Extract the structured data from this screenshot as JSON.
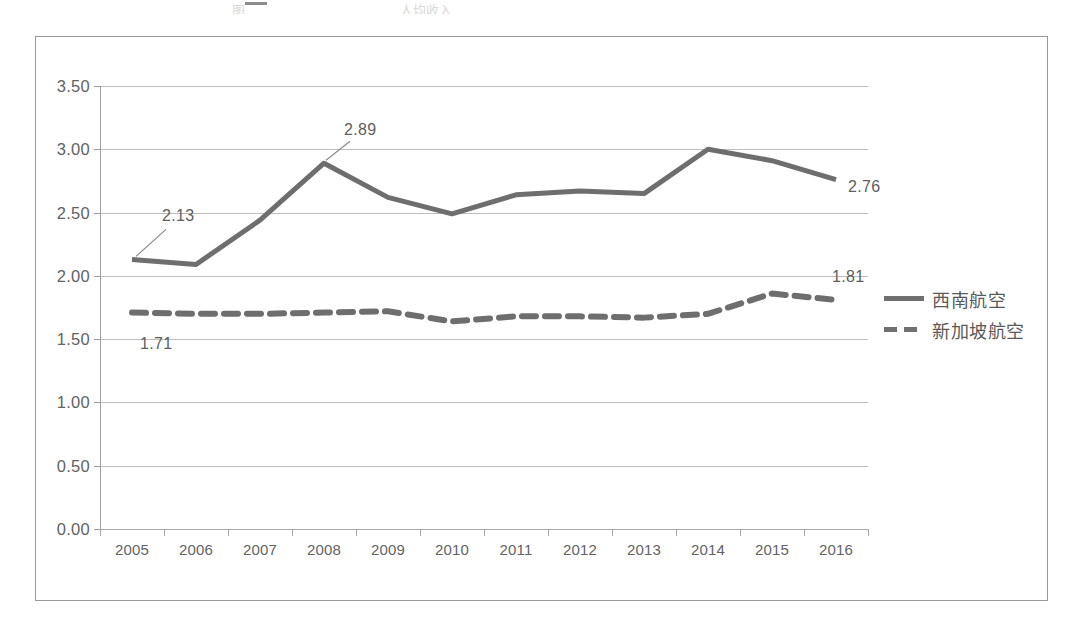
{
  "artifact": {
    "clipped_title_fragment": "图",
    "clipped_subtitle_fragment": "人均收入"
  },
  "chart_data": {
    "type": "line",
    "title": "",
    "xlabel": "",
    "ylabel": "",
    "x": [
      "2005",
      "2006",
      "2007",
      "2008",
      "2009",
      "2010",
      "2011",
      "2012",
      "2013",
      "2014",
      "2015",
      "2016"
    ],
    "categories": [
      "2005",
      "2006",
      "2007",
      "2008",
      "2009",
      "2010",
      "2011",
      "2012",
      "2013",
      "2014",
      "2015",
      "2016"
    ],
    "ylim": [
      0.0,
      3.5
    ],
    "yticks": [
      "0.00",
      "0.50",
      "1.00",
      "1.50",
      "2.00",
      "2.50",
      "3.00",
      "3.50"
    ],
    "ytick_values": [
      0.0,
      0.5,
      1.0,
      1.5,
      2.0,
      2.5,
      3.0,
      3.5
    ],
    "grid": true,
    "legend_position": "right",
    "series": [
      {
        "name": "西南航空",
        "style": "solid",
        "color": "#6e6e6e",
        "values": [
          2.13,
          2.09,
          2.44,
          2.89,
          2.62,
          2.49,
          2.64,
          2.67,
          2.65,
          3.0,
          2.91,
          2.76
        ]
      },
      {
        "name": "新加坡航空",
        "style": "dashed",
        "color": "#6e6e6e",
        "values": [
          1.71,
          1.7,
          1.7,
          1.71,
          1.72,
          1.64,
          1.68,
          1.68,
          1.67,
          1.7,
          1.86,
          1.81
        ]
      }
    ],
    "annotations": [
      {
        "text": "2.13",
        "series": "西南航空",
        "x": "2005",
        "value": 2.13
      },
      {
        "text": "2.89",
        "series": "西南航空",
        "x": "2008",
        "value": 2.89
      },
      {
        "text": "2.76",
        "series": "西南航空",
        "x": "2016",
        "value": 2.76
      },
      {
        "text": "1.71",
        "series": "新加坡航空",
        "x": "2005",
        "value": 1.71
      },
      {
        "text": "1.81",
        "series": "新加坡航空",
        "x": "2016",
        "value": 1.81
      }
    ]
  },
  "legend": {
    "items": [
      {
        "label": "西南航空",
        "style": "solid"
      },
      {
        "label": "新加坡航空",
        "style": "dashed"
      }
    ]
  }
}
